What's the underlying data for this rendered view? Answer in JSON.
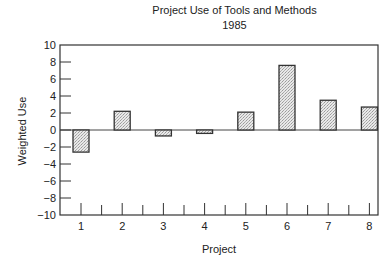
{
  "chart_data": {
    "type": "bar",
    "title": "Project Use of Tools and Methods",
    "subtitle": "1985",
    "xlabel": "Project",
    "ylabel": "Weighted Use",
    "categories": [
      "1",
      "2",
      "3",
      "4",
      "5",
      "6",
      "7",
      "8"
    ],
    "values": [
      -2.6,
      2.2,
      -0.7,
      -0.4,
      2.1,
      7.6,
      3.5,
      2.7
    ],
    "ylim": [
      -10,
      10
    ],
    "yticks": [
      10,
      8,
      6,
      4,
      2,
      0,
      -2,
      -4,
      -6,
      -8,
      -10
    ],
    "ytick_labels": [
      "10",
      "8",
      "6",
      "4",
      "2",
      "0",
      "−2",
      "−4",
      "−6",
      "−8",
      "−10"
    ],
    "grid": false,
    "legend": null,
    "bar_fill": "stippled light gray",
    "bar_color": "#d9d9d9"
  }
}
